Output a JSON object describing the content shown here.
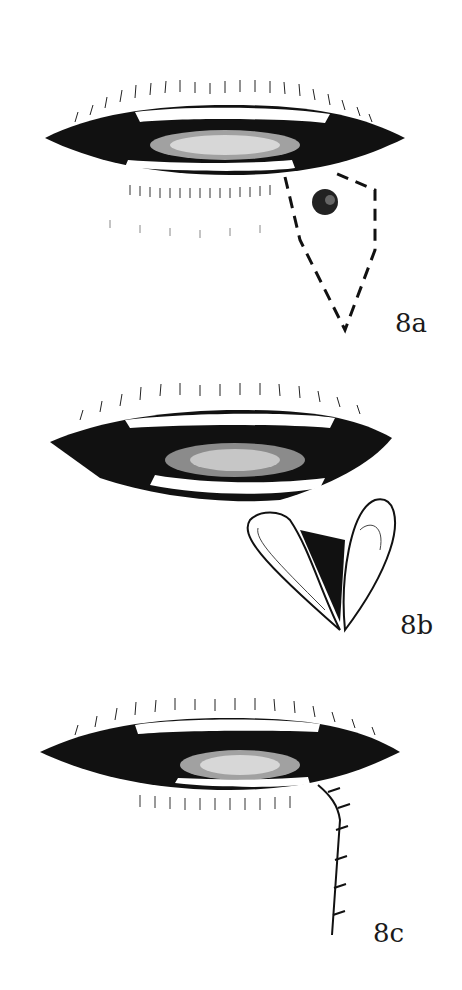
{
  "figure": {
    "panels": [
      {
        "id": "8a",
        "label": "8a",
        "description": "Lips with lesion on lower lip; dashed V-shaped (wedge) excision outline"
      },
      {
        "id": "8b",
        "label": "8b",
        "description": "Wedge excised; two flaps of lower lip opened showing teeth"
      },
      {
        "id": "8c",
        "label": "8c",
        "description": "Closed lip with sutured vertical incision line"
      }
    ],
    "colors": {
      "ink": "#111111",
      "background": "#ffffff"
    }
  }
}
